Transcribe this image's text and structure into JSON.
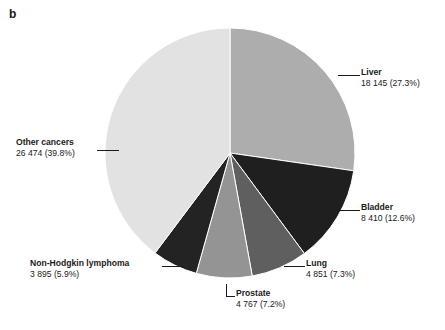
{
  "panel": {
    "letter": "b"
  },
  "chart_data": {
    "type": "pie",
    "title": "",
    "subtitle": "",
    "xlabel": "",
    "ylabel": "",
    "legend_position": "callout-labels",
    "grid": false,
    "total_count": 66542,
    "start_angle_deg": 0,
    "direction": "clockwise",
    "categories": [
      "Liver",
      "Bladder",
      "Lung",
      "Prostate",
      "Non-Hodgkin lymphoma",
      "Other cancers"
    ],
    "values": [
      18145,
      8410,
      4851,
      4767,
      3895,
      26474
    ],
    "percents": [
      27.3,
      12.6,
      7.3,
      7.2,
      5.9,
      39.8
    ],
    "value_labels": [
      "18 145",
      "8 410",
      "4 851",
      "4 767",
      "3 895",
      "26 474"
    ],
    "percent_labels": [
      "(27.3%)",
      "(12.6%)",
      "(7.3%)",
      "(7.2%)",
      "(5.9%)",
      "(39.8%)"
    ],
    "colors": [
      "#adadad",
      "#1f1f1f",
      "#5f5f5f",
      "#949494",
      "#232323",
      "#e2e2e2"
    ],
    "slices": [
      {
        "name": "Liver",
        "value": 18145,
        "value_label": "18 145",
        "percent": 27.3,
        "percent_label": "(27.3%)",
        "color": "#adadad"
      },
      {
        "name": "Bladder",
        "value": 8410,
        "value_label": "8 410",
        "percent": 12.6,
        "percent_label": "(12.6%)",
        "color": "#1f1f1f"
      },
      {
        "name": "Lung",
        "value": 4851,
        "value_label": "4 851",
        "percent": 7.3,
        "percent_label": "(7.3%)",
        "color": "#5f5f5f"
      },
      {
        "name": "Prostate",
        "value": 4767,
        "value_label": "4 767",
        "percent": 7.2,
        "percent_label": "(7.2%)",
        "color": "#949494"
      },
      {
        "name": "Non-Hodgkin lymphoma",
        "value": 3895,
        "value_label": "3 895",
        "percent": 5.9,
        "percent_label": "(5.9%)",
        "color": "#232323"
      },
      {
        "name": "Other cancers",
        "value": 26474,
        "value_label": "26 474",
        "percent": 39.8,
        "percent_label": "(39.8%)",
        "color": "#e2e2e2"
      }
    ]
  },
  "labels": {
    "liver": {
      "cat": "Liver",
      "val": "18 145 (27.3%)"
    },
    "bladder": {
      "cat": "Bladder",
      "val": "8 410 (12.6%)"
    },
    "lung": {
      "cat": "Lung",
      "val": "4 851 (7.3%)"
    },
    "prostate": {
      "cat": "Prostate",
      "val": "4 767 (7.2%)"
    },
    "nhl": {
      "cat": "Non-Hodgkin lymphoma",
      "val": "3 895 (5.9%)"
    },
    "other": {
      "cat": "Other cancers",
      "val": "26 474 (39.8%)"
    }
  }
}
